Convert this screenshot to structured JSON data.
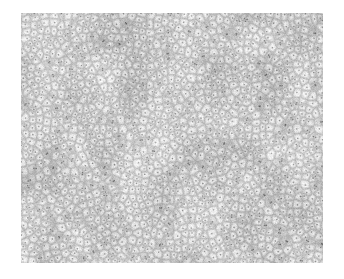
{
  "image": {
    "kind": "grayscale-micrograph-texture",
    "description": "Dense granular cellular texture field on white background",
    "background_color": "#ffffff",
    "plate": {
      "x": 21,
      "y": 13,
      "width": 302,
      "height": 250,
      "mean_gray": "#c8c8c8",
      "light_tone": "#e8e8e8",
      "mid_tone": "#b4b4b4",
      "dark_tone": "#4a4a4a",
      "darkest_tone": "#1e1e1e",
      "grain_cell_size_px": 7,
      "grain_density": "high",
      "noise_seed": 20240517
    }
  },
  "canvas_size": {
    "width": 344,
    "height": 279
  }
}
